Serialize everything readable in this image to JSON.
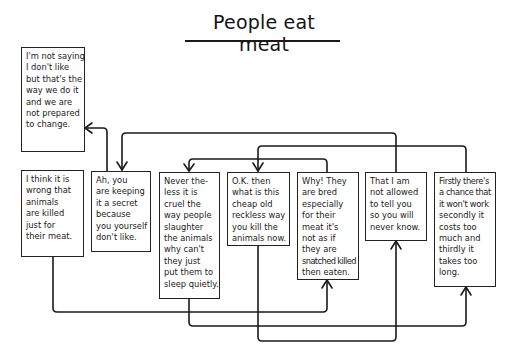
{
  "title": "People eat meat",
  "boxes": [
    {
      "id": "not-saying",
      "lines": [
        "I'm not saying",
        "I don't like",
        "but that's the",
        "way we do it",
        "and we are",
        "not prepared",
        "to change."
      ]
    },
    {
      "id": "i-think",
      "lines": [
        "I think it is",
        "wrong that",
        "animals",
        "are killed",
        "just for",
        "their meat."
      ]
    },
    {
      "id": "ah-you",
      "lines": [
        "Ah, you",
        "are keeping",
        "it a secret",
        "because",
        "you yourself",
        "don't like."
      ]
    },
    {
      "id": "nevertheless",
      "lines": [
        "Never the-",
        "less it is",
        "cruel the",
        "way people",
        "slaughter",
        "the animals",
        "why can't",
        "they just",
        "put them to",
        "sleep quietly."
      ]
    },
    {
      "id": "ok-then",
      "lines": [
        "O.K. then",
        "what is this",
        "cheap old",
        "reckless way",
        "you kill the",
        "animals now."
      ]
    },
    {
      "id": "why",
      "lines": [
        "Why! They",
        "are bred",
        "especially",
        "for their",
        "meat it's",
        "not as if",
        "they are",
        "snatched killed",
        "then eaten."
      ]
    },
    {
      "id": "not-allowed",
      "lines": [
        "That I am",
        "not allowed",
        "to tell you",
        "so you will",
        "never know."
      ]
    },
    {
      "id": "firstly",
      "lines": [
        "Firstly there's",
        "a chance that",
        "it won't work",
        "secondly it",
        "costs too",
        "much and",
        "thirdly it",
        "takes too",
        "long."
      ]
    }
  ],
  "connections": [
    {
      "from": "ah-you",
      "to": "not-saying"
    },
    {
      "from": "not-allowed",
      "to": "ah-you"
    },
    {
      "from": "firstly",
      "to": "ok-then"
    },
    {
      "from": "why",
      "to": "nevertheless"
    },
    {
      "from": "i-think",
      "to": "why"
    },
    {
      "from": "nevertheless",
      "to": "firstly"
    },
    {
      "from": "ok-then",
      "to": "not-allowed"
    }
  ],
  "colors": {
    "ink": "#1a1a1a",
    "background": "#ffffff"
  }
}
